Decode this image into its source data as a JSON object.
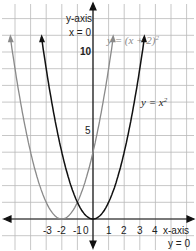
{
  "chart_data": {
    "type": "line",
    "title": "",
    "xlabel": "x-axis",
    "xlabel_sub": "y = 0",
    "ylabel": "y-axis",
    "ylabel_sub": "x = 0",
    "x_ticks": [
      "-3",
      "-2",
      "-1",
      "0",
      "1",
      "2",
      "3",
      "4"
    ],
    "y_ticks": [
      "5",
      "10"
    ],
    "xlim": [
      -5.9,
      6.4
    ],
    "ylim": [
      -1.6,
      12.4
    ],
    "grid": true,
    "series": [
      {
        "name": "y = (x + 2)²",
        "color": "#8a8a8a",
        "function": "(x+2)^2",
        "x_range": [
          -5.3,
          1.3
        ]
      },
      {
        "name": "y = x²",
        "color": "#111111",
        "function": "x^2",
        "x_range": [
          -3.3,
          3.3
        ]
      }
    ],
    "annotations": [
      {
        "text": "y = (x + 2)²",
        "near": [
          1.5,
          10.3
        ]
      },
      {
        "text": "y = x²",
        "near": [
          4.3,
          5.8
        ]
      }
    ]
  },
  "labels": {
    "y_axis": "y-axis",
    "y_axis_eq": "x = 0",
    "x_axis": "x-axis",
    "x_axis_eq": "y = 0",
    "y10": "10",
    "y5": "5",
    "xm3": "-3",
    "xm2": "-2",
    "xm1": "-1",
    "x0": "0",
    "x1": "1",
    "x2": "2",
    "x3": "3",
    "x4": "4",
    "curve_shifted": "y = (x + 2)",
    "curve_shifted_exp": "2",
    "curve_base": "y = x",
    "curve_base_exp": "2"
  }
}
